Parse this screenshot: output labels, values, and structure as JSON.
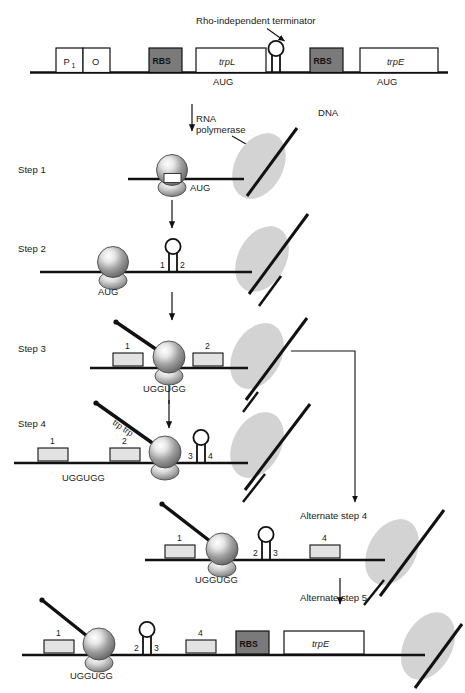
{
  "figure": {
    "annotations": {
      "terminator": "Rho-independent terminator",
      "rna_polymerase": "RNA\npolymerase",
      "rna_polymerase_line1": "RNA",
      "rna_polymerase_line2": "polymerase",
      "dna": "DNA",
      "trp_trp": "trp trp"
    },
    "colors": {
      "line": "#111111",
      "rbs_fill": "#7a7a7a",
      "gene_fill": "#ffffff",
      "segment_fill": "#e2e2e2",
      "polymerase_fill": "#d3d3d3",
      "ribosome_light": "#f2f2f2",
      "ribosome_dark": "#6e6e6e",
      "background": "#ffffff"
    },
    "operon_map": {
      "elements": [
        {
          "name": "promoter",
          "label": "P",
          "subscript": "1"
        },
        {
          "name": "operator",
          "label": "O"
        },
        {
          "name": "rbs-1",
          "label": "RBS"
        },
        {
          "name": "trpL-gene",
          "label": "trpL"
        },
        {
          "name": "start-codon-1",
          "label": "AUG"
        },
        {
          "name": "terminator-hairpin",
          "label": ""
        },
        {
          "name": "rbs-2",
          "label": "RBS"
        },
        {
          "name": "trpE-gene",
          "label": "trpE"
        },
        {
          "name": "start-codon-2",
          "label": "AUG"
        }
      ]
    },
    "steps": [
      {
        "id": "step-1",
        "label": "Step 1",
        "codon": "AUG",
        "boxes": [],
        "hairpins": []
      },
      {
        "id": "step-2",
        "label": "Step 2",
        "codon": "AUG",
        "boxes": [],
        "hairpins": [
          {
            "left_label": "1",
            "right_label": "2"
          }
        ]
      },
      {
        "id": "step-3",
        "label": "Step 3",
        "codon": "UGGUGG",
        "boxes": [
          {
            "label": "1"
          },
          {
            "label": "2"
          }
        ],
        "hairpins": []
      },
      {
        "id": "step-4",
        "label": "Step 4",
        "codon": "UGGUGG",
        "boxes": [
          {
            "label": "1"
          },
          {
            "label": "2"
          }
        ],
        "hairpins": [
          {
            "left_label": "3",
            "right_label": "4"
          }
        ]
      },
      {
        "id": "alternate-step-4",
        "label": "Alternate step 4",
        "codon": "UGGUGG",
        "boxes": [
          {
            "label": "1"
          },
          {
            "label": "4"
          }
        ],
        "hairpins": [
          {
            "left_label": "2",
            "right_label": "3"
          }
        ]
      },
      {
        "id": "alternate-step-5",
        "label": "Alternate step 5",
        "codon": "UGGUGG",
        "boxes": [
          {
            "label": "1"
          },
          {
            "label": "4"
          }
        ],
        "hairpins": [
          {
            "left_label": "2",
            "right_label": "3"
          }
        ],
        "rbs_label": "RBS",
        "gene_label": "trpE"
      }
    ]
  }
}
